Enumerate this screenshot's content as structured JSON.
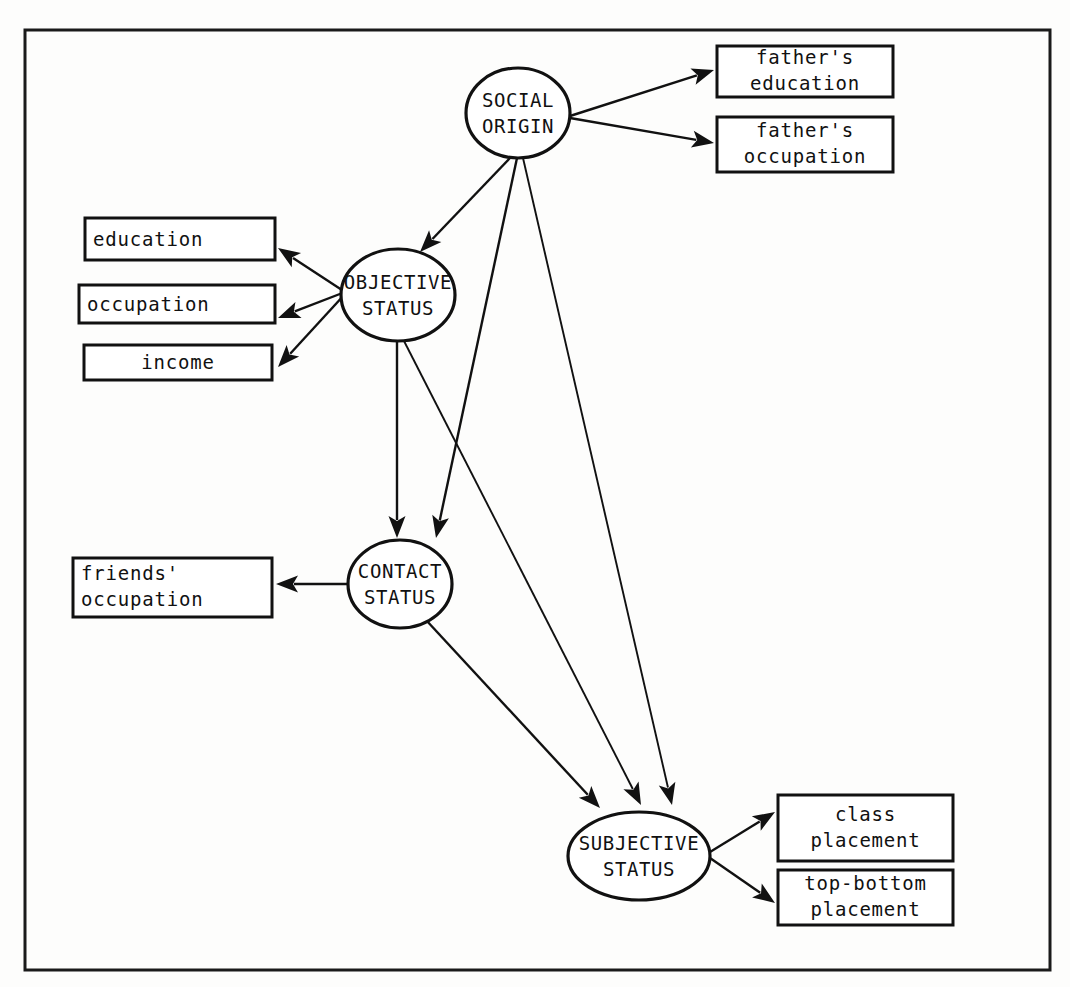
{
  "figure": {
    "type": "path-diagram",
    "frame": {
      "x": 25,
      "y": 30,
      "width": 1025,
      "height": 940
    }
  },
  "latent_constructs": [
    {
      "id": "social-origin",
      "line1": "SOCIAL",
      "line2": "ORIGIN",
      "cx": 518,
      "cy": 113,
      "rx": 52,
      "ry": 45
    },
    {
      "id": "objective-status",
      "line1": "OBJECTIVE",
      "line2": "STATUS",
      "cx": 398,
      "cy": 295,
      "rx": 57,
      "ry": 46
    },
    {
      "id": "contact-status",
      "line1": "CONTACT",
      "line2": "STATUS",
      "cx": 400,
      "cy": 584,
      "rx": 52,
      "ry": 44
    },
    {
      "id": "subjective-status",
      "line1": "SUBJECTIVE",
      "line2": "STATUS",
      "cx": 639,
      "cy": 856,
      "rx": 71,
      "ry": 44
    }
  ],
  "indicators": [
    {
      "id": "fathers-education",
      "line1": "father's",
      "line2": "education",
      "align": "center",
      "x": 717,
      "y": 46,
      "width": 176,
      "height": 51
    },
    {
      "id": "fathers-occupation",
      "line1": "father's",
      "line2": "occupation",
      "align": "center",
      "x": 717,
      "y": 117,
      "width": 176,
      "height": 55
    },
    {
      "id": "education",
      "line1": "education",
      "line2": "",
      "align": "left",
      "x": 85,
      "y": 218,
      "width": 190,
      "height": 42
    },
    {
      "id": "occupation",
      "line1": "occupation",
      "line2": "",
      "align": "left",
      "x": 79,
      "y": 285,
      "width": 196,
      "height": 38
    },
    {
      "id": "income",
      "line1": "income",
      "line2": "",
      "align": "center",
      "x": 84,
      "y": 345,
      "width": 188,
      "height": 35
    },
    {
      "id": "friends-occupation",
      "line1": "friends'",
      "line2": "occupation",
      "align": "left",
      "x": 73,
      "y": 558,
      "width": 199,
      "height": 59
    },
    {
      "id": "class-placement",
      "line1": "class",
      "line2": "placement",
      "align": "center",
      "x": 778,
      "y": 795,
      "width": 175,
      "height": 66
    },
    {
      "id": "top-bottom-placement",
      "line1": "top-bottom",
      "line2": "placement",
      "align": "center",
      "x": 778,
      "y": 870,
      "width": 175,
      "height": 55
    }
  ],
  "edges": [
    {
      "id": "social-origin-to-fathers-education",
      "from": "social-origin",
      "to": "fathers-education",
      "x1": 570,
      "y1": 116,
      "x2": 714,
      "y2": 70
    },
    {
      "id": "social-origin-to-fathers-occupation",
      "from": "social-origin",
      "to": "fathers-occupation",
      "x1": 570,
      "y1": 118,
      "x2": 714,
      "y2": 143
    },
    {
      "id": "social-origin-to-objective-status",
      "from": "social-origin",
      "to": "objective-status",
      "x1": 510,
      "y1": 158,
      "x2": 420,
      "y2": 252
    },
    {
      "id": "social-origin-to-contact-status",
      "from": "social-origin",
      "to": "contact-status",
      "x1": 517,
      "y1": 158,
      "x2": 436,
      "y2": 538
    },
    {
      "id": "social-origin-to-subjective-status",
      "from": "social-origin",
      "to": "subjective-status",
      "x1": 523,
      "y1": 158,
      "x2": 672,
      "y2": 805
    },
    {
      "id": "objective-status-to-education",
      "from": "objective-status",
      "to": "education",
      "x1": 345,
      "y1": 292,
      "x2": 278,
      "y2": 248
    },
    {
      "id": "objective-status-to-occupation",
      "from": "objective-status",
      "to": "occupation",
      "x1": 345,
      "y1": 292,
      "x2": 278,
      "y2": 318
    },
    {
      "id": "objective-status-to-income",
      "from": "objective-status",
      "to": "income",
      "x1": 345,
      "y1": 294,
      "x2": 278,
      "y2": 367
    },
    {
      "id": "objective-status-to-contact-status",
      "from": "objective-status",
      "to": "contact-status",
      "x1": 397,
      "y1": 341,
      "x2": 397,
      "y2": 538
    },
    {
      "id": "objective-status-to-subjective-status",
      "from": "objective-status",
      "to": "subjective-status",
      "x1": 404,
      "y1": 341,
      "x2": 641,
      "y2": 805
    },
    {
      "id": "contact-status-to-friends-occupation",
      "from": "contact-status",
      "to": "friends-occupation",
      "x1": 348,
      "y1": 584,
      "x2": 276,
      "y2": 584
    },
    {
      "id": "contact-status-to-subjective-status",
      "from": "contact-status",
      "to": "subjective-status",
      "x1": 426,
      "y1": 620,
      "x2": 600,
      "y2": 808
    },
    {
      "id": "subjective-status-to-class-placement",
      "from": "subjective-status",
      "to": "class-placement",
      "x1": 710,
      "y1": 852,
      "x2": 775,
      "y2": 812
    },
    {
      "id": "subjective-status-to-top-bottom",
      "from": "subjective-status",
      "to": "top-bottom-placement",
      "x1": 710,
      "y1": 858,
      "x2": 775,
      "y2": 903
    }
  ]
}
